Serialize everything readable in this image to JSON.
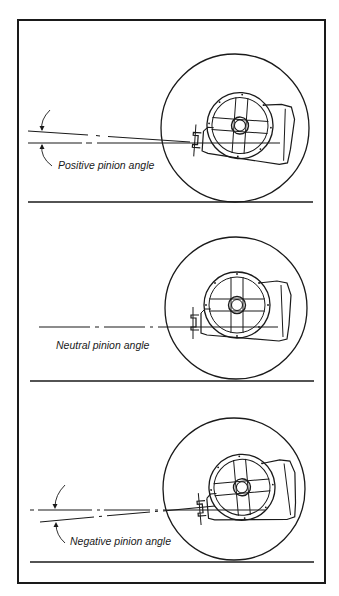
{
  "figure": {
    "panels": [
      {
        "id": "positive",
        "label": "Positive pinion angle",
        "angle_direction": "positive"
      },
      {
        "id": "neutral",
        "label": "Neutral pinion angle",
        "angle_direction": "neutral"
      },
      {
        "id": "negative",
        "label": "Negative pinion angle",
        "angle_direction": "negative"
      }
    ],
    "colors": {
      "ink": "#1a1a1a",
      "background": "#ffffff"
    }
  }
}
